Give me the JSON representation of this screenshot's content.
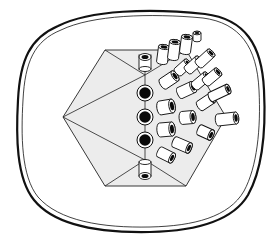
{
  "figure": {
    "type": "scientific-illustration",
    "colors": {
      "background": "#ffffff",
      "stroke": "#111111",
      "facet_fill": "#ececec",
      "tube_body": "#ffffff",
      "lumen": "#0a0a0a"
    },
    "outer_membrane": {
      "style": "double-line",
      "outer_width": 2.2,
      "inner_width": 0.8
    },
    "hexagon": {
      "vertices": [
        [
          63,
          117
        ],
        [
          105,
          50
        ],
        [
          186,
          50
        ],
        [
          226,
          117
        ],
        [
          186,
          186
        ],
        [
          105,
          186
        ]
      ],
      "apex": [
        63,
        117
      ]
    },
    "end_on_tubes": [
      {
        "cx": 145,
        "cy": 61,
        "r": 6
      },
      {
        "cx": 145,
        "cy": 93,
        "r": 8
      },
      {
        "cx": 145,
        "cy": 117,
        "r": 8
      },
      {
        "cx": 145,
        "cy": 140,
        "r": 8
      },
      {
        "cx": 145,
        "cy": 175,
        "r": 6
      }
    ],
    "side_tubes": [
      {
        "x1": 162,
        "y1": 62,
        "x2": 164,
        "y2": 47,
        "r": 5.5
      },
      {
        "x1": 173,
        "y1": 58,
        "x2": 175,
        "y2": 42,
        "r": 5.5
      },
      {
        "x1": 185,
        "y1": 52,
        "x2": 187,
        "y2": 37,
        "r": 5.5
      },
      {
        "x1": 197,
        "y1": 40,
        "x2": 197,
        "y2": 33,
        "r": 4
      },
      {
        "x1": 163,
        "y1": 84,
        "x2": 175,
        "y2": 76,
        "r": 6
      },
      {
        "x1": 178,
        "y1": 72,
        "x2": 188,
        "y2": 63,
        "r": 5
      },
      {
        "x1": 188,
        "y1": 70,
        "x2": 199,
        "y2": 60,
        "r": 5
      },
      {
        "x1": 199,
        "y1": 64,
        "x2": 211,
        "y2": 53,
        "r": 5
      },
      {
        "x1": 180,
        "y1": 93,
        "x2": 193,
        "y2": 87,
        "r": 6
      },
      {
        "x1": 195,
        "y1": 86,
        "x2": 207,
        "y2": 76,
        "r": 5
      },
      {
        "x1": 206,
        "y1": 82,
        "x2": 218,
        "y2": 72,
        "r": 5
      },
      {
        "x1": 160,
        "y1": 108,
        "x2": 172,
        "y2": 106,
        "r": 7
      },
      {
        "x1": 200,
        "y1": 106,
        "x2": 212,
        "y2": 98,
        "r": 5.5
      },
      {
        "x1": 211,
        "y1": 97,
        "x2": 228,
        "y2": 89,
        "r": 5
      },
      {
        "x1": 182,
        "y1": 118,
        "x2": 193,
        "y2": 117,
        "r": 6.5
      },
      {
        "x1": 218,
        "y1": 120,
        "x2": 236,
        "y2": 118,
        "r": 6
      },
      {
        "x1": 160,
        "y1": 130,
        "x2": 172,
        "y2": 129,
        "r": 7
      },
      {
        "x1": 200,
        "y1": 130,
        "x2": 211,
        "y2": 135,
        "r": 5.5
      },
      {
        "x1": 175,
        "y1": 142,
        "x2": 189,
        "y2": 148,
        "r": 5.5
      },
      {
        "x1": 160,
        "y1": 152,
        "x2": 172,
        "y2": 158,
        "r": 5.5
      }
    ]
  },
  "caption": {
    "text": ""
  }
}
